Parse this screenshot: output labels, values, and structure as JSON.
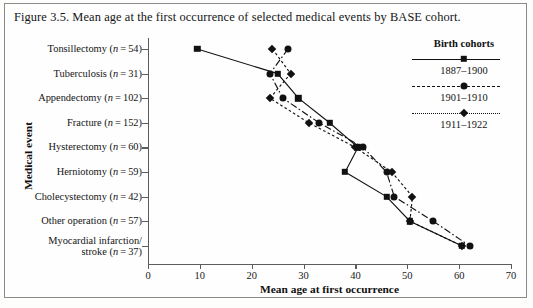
{
  "figure": {
    "title": "Figure 3.5. Mean age at the first occurrence of selected medical events by BASE cohort.",
    "border_color": "#8a8a8a"
  },
  "axis": {
    "y_title": "Medical event",
    "x_title": "Mean age at first occurrence",
    "x_ticks": [
      "0",
      "10",
      "20",
      "30",
      "40",
      "50",
      "60",
      "70"
    ],
    "x_min": 0,
    "x_max": 70
  },
  "legend": {
    "title": "Birth cohorts",
    "entries": [
      {
        "label": "1887–1900",
        "marker": "square-marker",
        "style": "solid"
      },
      {
        "label": "1901–1910",
        "marker": "circle-marker",
        "style": "dash-dot"
      },
      {
        "label": "1911–1922",
        "marker": "diamond-marker",
        "style": "dotted"
      }
    ]
  },
  "categories": [
    {
      "name": "Tonsillectomy",
      "n": "54",
      "label": "Tonsillectomy (n = 54)"
    },
    {
      "name": "Tuberculosis",
      "n": "31",
      "label": "Tuberculosis (n = 31)"
    },
    {
      "name": "Appendectomy",
      "n": "102",
      "label": "Appendectomy (n = 102)"
    },
    {
      "name": "Fracture",
      "n": "152",
      "label": "Fracture (n = 152)"
    },
    {
      "name": "Hysterectomy",
      "n": "60",
      "label": "Hysterectomy (n = 60)"
    },
    {
      "name": "Herniotomy",
      "n": "59",
      "label": "Herniotomy (n = 59)"
    },
    {
      "name": "Cholecystectomy",
      "n": "42",
      "label": "Cholecystectomy (n = 42)"
    },
    {
      "name": "Other operation",
      "n": "57",
      "label": "Other operation (n = 57)"
    },
    {
      "name": "Myocardial infarction/stroke",
      "n": "37",
      "label": "Myocardial infarction/\nstroke (n = 37)"
    }
  ],
  "chart_data": {
    "type": "line",
    "title": "Mean age at the first occurrence of selected medical events by BASE cohort",
    "xlabel": "Mean age at first occurrence",
    "ylabel": "Medical event",
    "xlim": [
      0,
      70
    ],
    "grid": false,
    "legend_position": "top-right",
    "orientation": "horizontal-categories",
    "categories": [
      "Tonsillectomy (n=54)",
      "Tuberculosis (n=31)",
      "Appendectomy (n=102)",
      "Fracture (n=152)",
      "Hysterectomy (n=60)",
      "Herniotomy (n=59)",
      "Cholecystectomy (n=42)",
      "Other operation (n=57)",
      "Myocardial infarction/stroke (n=37)"
    ],
    "series": [
      {
        "name": "1887–1900",
        "marker": "square",
        "linestyle": "solid",
        "values": [
          9.5,
          25.0,
          29.0,
          35.0,
          40.5,
          38.0,
          46.0,
          50.5,
          60.5
        ]
      },
      {
        "name": "1901–1910",
        "marker": "circle",
        "linestyle": "dash-dot",
        "values": [
          27.0,
          23.5,
          26.0,
          33.0,
          41.5,
          46.0,
          47.5,
          55.0,
          62.0
        ]
      },
      {
        "name": "1911–1922",
        "marker": "diamond",
        "linestyle": "dotted",
        "values": [
          24.0,
          27.5,
          23.5,
          31.0,
          40.0,
          47.0,
          51.0,
          50.5,
          60.5
        ]
      }
    ]
  }
}
